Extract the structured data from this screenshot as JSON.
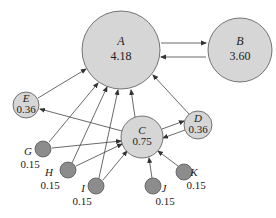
{
  "diagram": {
    "type": "pagerank-graph",
    "colors": {
      "light_node": "#d6d6d6",
      "dark_node": "#8c8c8c",
      "stroke": "#555555",
      "edge": "#444444"
    },
    "nodes": [
      {
        "id": "A",
        "label": "A",
        "value": "4.18",
        "cx": 121,
        "cy": 50,
        "r": 39,
        "shade": "light",
        "label_inside": true
      },
      {
        "id": "B",
        "label": "B",
        "value": "3.60",
        "cx": 240,
        "cy": 50,
        "r": 32,
        "shade": "light",
        "label_inside": true
      },
      {
        "id": "C",
        "label": "C",
        "value": "0.75",
        "cx": 142,
        "cy": 137,
        "r": 21,
        "shade": "light",
        "label_inside": true
      },
      {
        "id": "D",
        "label": "D",
        "value": "0.36",
        "cx": 198,
        "cy": 125,
        "r": 14,
        "shade": "light",
        "label_inside": true
      },
      {
        "id": "E",
        "label": "E",
        "value": "0.36",
        "cx": 26,
        "cy": 105,
        "r": 13,
        "shade": "light",
        "label_inside": true
      },
      {
        "id": "G",
        "label": "G",
        "value": "0.15",
        "cx": 43,
        "cy": 149,
        "r": 8,
        "shade": "dark",
        "label_inside": false,
        "lx": 28,
        "ly": 155,
        "vx": 30,
        "vy": 168
      },
      {
        "id": "H",
        "label": "H",
        "value": "0.15",
        "cx": 68,
        "cy": 170,
        "r": 8,
        "shade": "dark",
        "label_inside": false,
        "lx": 49,
        "ly": 176,
        "vx": 50,
        "vy": 189
      },
      {
        "id": "I",
        "label": "I",
        "value": "0.15",
        "cx": 96,
        "cy": 186,
        "r": 8,
        "shade": "dark",
        "label_inside": false,
        "lx": 83,
        "ly": 192,
        "vx": 82,
        "vy": 205
      },
      {
        "id": "J",
        "label": "J",
        "value": "0.15",
        "cx": 153,
        "cy": 186,
        "r": 8,
        "shade": "dark",
        "label_inside": false,
        "lx": 164,
        "ly": 192,
        "vx": 165,
        "vy": 205
      },
      {
        "id": "K",
        "label": "K",
        "value": "0.15",
        "cx": 184,
        "cy": 172,
        "r": 8,
        "shade": "dark",
        "label_inside": false,
        "lx": 194,
        "ly": 176,
        "vx": 196,
        "vy": 189
      }
    ],
    "edges": [
      {
        "from": "A",
        "to": "B",
        "x1": 161,
        "y1": 43,
        "x2": 206,
        "y2": 43
      },
      {
        "from": "B",
        "to": "A",
        "x1": 206,
        "y1": 57,
        "x2": 161,
        "y2": 57
      },
      {
        "from": "E",
        "to": "A",
        "x1": 38,
        "y1": 98,
        "x2": 86,
        "y2": 69
      },
      {
        "from": "C",
        "to": "E",
        "x1": 122,
        "y1": 131,
        "x2": 40,
        "y2": 109
      },
      {
        "from": "C",
        "to": "A",
        "x1": 135,
        "y1": 117,
        "x2": 131,
        "y2": 90
      },
      {
        "from": "G",
        "to": "A",
        "x1": 49,
        "y1": 142,
        "x2": 98,
        "y2": 83
      },
      {
        "from": "H",
        "to": "A",
        "x1": 72,
        "y1": 163,
        "x2": 107,
        "y2": 87
      },
      {
        "from": "I",
        "to": "A",
        "x1": 99,
        "y1": 178,
        "x2": 118,
        "y2": 90
      },
      {
        "from": "D",
        "to": "A",
        "x1": 189,
        "y1": 114,
        "x2": 153,
        "y2": 75
      },
      {
        "from": "G",
        "to": "C",
        "x1": 52,
        "y1": 148,
        "x2": 121,
        "y2": 141
      },
      {
        "from": "H",
        "to": "C",
        "x1": 76,
        "y1": 166,
        "x2": 122,
        "y2": 144
      },
      {
        "from": "I",
        "to": "C",
        "x1": 103,
        "y1": 180,
        "x2": 127,
        "y2": 151
      },
      {
        "from": "C",
        "to": "D",
        "x1": 162,
        "y1": 129,
        "x2": 184,
        "y2": 121
      },
      {
        "from": "D",
        "to": "C",
        "x1": 185,
        "y1": 130,
        "x2": 163,
        "y2": 138
      },
      {
        "from": "J",
        "to": "C",
        "x1": 152,
        "y1": 178,
        "x2": 149,
        "y2": 158
      },
      {
        "from": "K",
        "to": "C",
        "x1": 178,
        "y1": 166,
        "x2": 158,
        "y2": 151
      }
    ]
  }
}
